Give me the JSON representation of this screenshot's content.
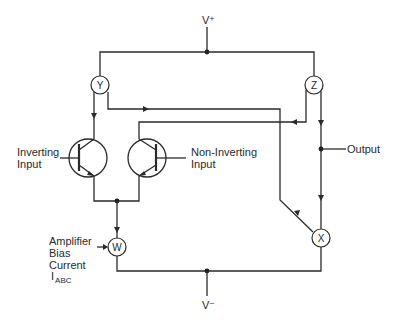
{
  "diagram": {
    "type": "OTA current-mirror schematic",
    "supplies": {
      "positive": "V⁺",
      "negative": "V⁻"
    },
    "current_sources": [
      {
        "id": "Y",
        "label": "Y"
      },
      {
        "id": "Z",
        "label": "Z"
      },
      {
        "id": "W",
        "label": "W"
      },
      {
        "id": "X",
        "label": "X"
      }
    ],
    "inputs": {
      "inverting": {
        "line1": "Inverting",
        "line2": "Input"
      },
      "non_inverting": {
        "line1": "Non-Inverting",
        "line2": "Input"
      }
    },
    "output": {
      "label": "Output"
    },
    "bias": {
      "line1": "Amplifier",
      "line2": "Bias",
      "line3": "Current",
      "symbol_main": "I",
      "symbol_sub": "ABC"
    },
    "colors": {
      "ink": "#2a2a2a",
      "background": "#ffffff"
    }
  }
}
